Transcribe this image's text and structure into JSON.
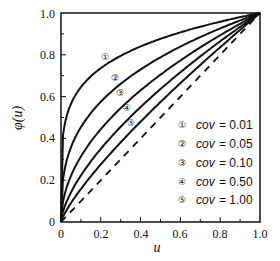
{
  "chart_data": {
    "type": "line",
    "title": "",
    "xlabel": "u",
    "ylabel": "φ(u)",
    "xlim": [
      0,
      1.0
    ],
    "ylim": [
      0,
      1.0
    ],
    "x_ticks": [
      "0",
      "0.2",
      "0.4",
      "0.6",
      "0.8",
      "1.0"
    ],
    "y_ticks": [
      "0",
      "0.2",
      "0.4",
      "0.6",
      "0.8",
      "1.0"
    ],
    "grid": false,
    "legend_position": "lower right inside",
    "series": [
      {
        "name": "cov = 0.01",
        "marker": "①",
        "x": [
          0,
          0.1,
          0.2,
          0.4,
          0.6,
          0.8,
          1.0
        ],
        "values": [
          0,
          0.63,
          0.73,
          0.84,
          0.91,
          0.96,
          1.0
        ]
      },
      {
        "name": "cov = 0.05",
        "marker": "②",
        "x": [
          0,
          0.1,
          0.2,
          0.4,
          0.6,
          0.8,
          1.0
        ],
        "values": [
          0,
          0.45,
          0.57,
          0.73,
          0.84,
          0.93,
          1.0
        ]
      },
      {
        "name": "cov = 0.10",
        "marker": "③",
        "x": [
          0,
          0.1,
          0.2,
          0.4,
          0.6,
          0.8,
          1.0
        ],
        "values": [
          0,
          0.32,
          0.45,
          0.63,
          0.77,
          0.89,
          1.0
        ]
      },
      {
        "name": "cov = 0.50",
        "marker": "④",
        "x": [
          0,
          0.1,
          0.2,
          0.4,
          0.6,
          0.8,
          1.0
        ],
        "values": [
          0,
          0.22,
          0.35,
          0.55,
          0.72,
          0.86,
          1.0
        ]
      },
      {
        "name": "cov = 1.00",
        "marker": "⑤",
        "x": [
          0,
          0.1,
          0.2,
          0.4,
          0.6,
          0.8,
          1.0
        ],
        "values": [
          0,
          0.16,
          0.28,
          0.48,
          0.66,
          0.84,
          1.0
        ]
      },
      {
        "name": "reference u = φ(u)",
        "style": "dashed",
        "x": [
          0,
          1.0
        ],
        "values": [
          0,
          1.0
        ]
      }
    ]
  },
  "axes": {
    "xlabel": "u",
    "ylabel": "φ(u)",
    "x_ticks": [
      "0",
      "0.2",
      "0.4",
      "0.6",
      "0.8",
      "1.0"
    ],
    "y_ticks": [
      "0",
      "0.2",
      "0.4",
      "0.6",
      "0.8",
      "1.0"
    ]
  },
  "legend": [
    {
      "marker": "①",
      "var": "cov",
      "value": "= 0.01"
    },
    {
      "marker": "②",
      "var": "cov",
      "value": "= 0.05"
    },
    {
      "marker": "③",
      "var": "cov",
      "value": "= 0.10"
    },
    {
      "marker": "④",
      "var": "cov",
      "value": "= 0.50"
    },
    {
      "marker": "⑤",
      "var": "cov",
      "value": "= 1.00"
    }
  ],
  "curve_labels": [
    "①",
    "②",
    "③",
    "④",
    "⑤"
  ]
}
